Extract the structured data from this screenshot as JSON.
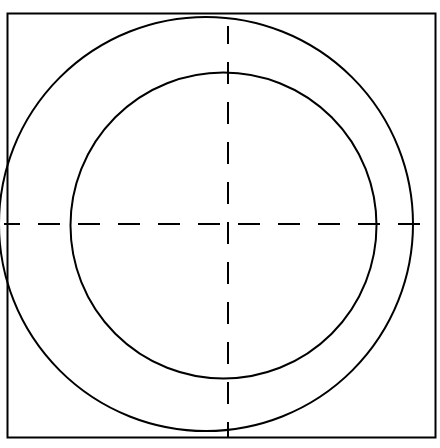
{
  "drawing": {
    "title": "Concentric Circles Technical Drawing",
    "canvas": {
      "width": 440,
      "height": 448,
      "background_color": "#ffffff"
    },
    "stroke_color": "#000000",
    "frame": {
      "name": "border-frame",
      "shape": "rectangle",
      "x": 7.5,
      "y": 13.5,
      "width": 428,
      "height": 424,
      "stroke_width": 2.0,
      "fill": "none"
    },
    "outer_circle": {
      "name": "outer-circle",
      "shape": "circle",
      "cx": 206,
      "cy": 224,
      "r": 207,
      "stroke_width": 2.0,
      "fill": "none",
      "diameter": 414
    },
    "inner_circle": {
      "name": "inner-circle",
      "shape": "circle",
      "cx": 223.5,
      "cy": 225.5,
      "r": 153,
      "stroke_width": 2.0,
      "fill": "none",
      "diameter": 306
    },
    "annulus": {
      "name": "annulus-ring",
      "nominal_width": 54
    },
    "centerlines": {
      "name": "center-crosshair",
      "style": "dashed",
      "dash_length": 22,
      "gap_length": 18,
      "stroke_width": 2.0,
      "center_x": 228,
      "center_y": 224,
      "horizontal": {
        "name": "horizontal-centerline",
        "x1": 4,
        "x2": 437,
        "y": 224
      },
      "vertical": {
        "name": "vertical-centerline",
        "y1": 26,
        "y2": 437,
        "x": 228
      }
    }
  }
}
